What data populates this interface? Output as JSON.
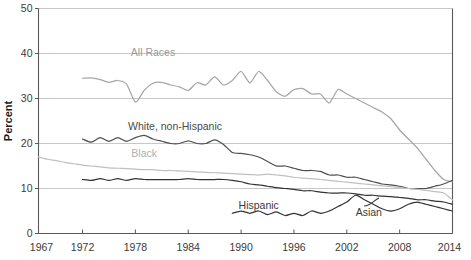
{
  "chart_data": {
    "type": "line",
    "title": "",
    "subtitle": "",
    "xlabel": "",
    "ylabel": "Percent",
    "xlim": [
      1967,
      2014
    ],
    "ylim": [
      0,
      50
    ],
    "grid": true,
    "legend_position": "inline-annotations",
    "y_ticks": [
      0,
      10,
      20,
      30,
      40,
      50
    ],
    "y_tick_labels": [
      "0",
      "10",
      "20",
      "30",
      "40",
      "50"
    ],
    "x_ticks": [
      1967,
      1972,
      1978,
      1984,
      1990,
      1996,
      2002,
      2008,
      2014
    ],
    "x_tick_labels": [
      "1967",
      "1972",
      "1978",
      "1984",
      "1990",
      "1996",
      "2002",
      "2008",
      "2014"
    ],
    "annotations": [
      {
        "text": "All Races",
        "x": 1980.0,
        "y": 39.5,
        "color": "#9a9a9a"
      },
      {
        "text": "White, non-Hispanic",
        "x": 1982.5,
        "y": 23.0,
        "color": "#4a4a4a"
      },
      {
        "text": "Black",
        "x": 1979.0,
        "y": 17.0,
        "color": "#b0b0b0"
      },
      {
        "text": "Hispanic",
        "x": 1992.0,
        "y": 5.5,
        "color": "#3a3a3a"
      },
      {
        "text": "Asian",
        "x": 2004.5,
        "y": 4.0,
        "color": "#3a3a3a"
      }
    ],
    "series": [
      {
        "name": "All Races",
        "color": "#a6a6a6",
        "x": [
          1972,
          1973,
          1974,
          1975,
          1976,
          1977,
          1978,
          1979,
          1980,
          1981,
          1982,
          1983,
          1984,
          1985,
          1986,
          1987,
          1988,
          1989,
          1990,
          1991,
          1992,
          1993,
          1994,
          1995,
          1996,
          1997,
          1998,
          1999,
          2000,
          2001,
          2002,
          2003,
          2004,
          2005,
          2006,
          2007,
          2008,
          2009,
          2010,
          2011,
          2012,
          2013,
          2014
        ],
        "values": [
          34.5,
          34.6,
          34.2,
          33.6,
          34.0,
          33.2,
          29.2,
          31.8,
          33.4,
          33.6,
          33.0,
          32.6,
          31.8,
          33.5,
          33.0,
          34.8,
          33.0,
          34.0,
          36.0,
          33.5,
          36.0,
          34.0,
          31.5,
          30.5,
          32.0,
          32.2,
          31.0,
          31.0,
          29.0,
          32.0,
          31.0,
          30.0,
          29.0,
          28.0,
          27.0,
          25.5,
          23.0,
          21.0,
          19.0,
          16.5,
          14.0,
          12.0,
          11.5
        ]
      },
      {
        "name": "White, non-Hispanic",
        "color": "#4f4f4f",
        "x": [
          1972,
          1973,
          1974,
          1975,
          1976,
          1977,
          1978,
          1979,
          1980,
          1981,
          1982,
          1983,
          1984,
          1985,
          1986,
          1987,
          1988,
          1989,
          1990,
          1991,
          1992,
          1993,
          1994,
          1995,
          1996,
          1997,
          1998,
          1999,
          2000,
          2001,
          2002,
          2003,
          2004,
          2005,
          2006,
          2007,
          2008,
          2009,
          2010,
          2011,
          2012,
          2013,
          2014
        ],
        "values": [
          21.0,
          20.3,
          21.3,
          20.5,
          21.3,
          20.5,
          21.3,
          21.8,
          21.0,
          20.5,
          20.0,
          20.0,
          20.6,
          20.0,
          20.0,
          20.8,
          19.8,
          18.0,
          17.8,
          17.5,
          17.0,
          16.0,
          15.0,
          15.0,
          14.5,
          14.0,
          14.0,
          13.8,
          13.0,
          13.0,
          12.5,
          12.5,
          12.0,
          11.5,
          11.0,
          10.8,
          10.5,
          10.0,
          10.0,
          10.0,
          10.5,
          11.0,
          11.8
        ]
      },
      {
        "name": "Black",
        "color": "#c0c0c0",
        "x": [
          1967,
          1968,
          1969,
          1970,
          1971,
          1972,
          1973,
          1974,
          1975,
          1976,
          1977,
          1978,
          1979,
          1980,
          1981,
          1982,
          1983,
          1984,
          1985,
          1986,
          1987,
          1988,
          1989,
          1990,
          1991,
          1992,
          1993,
          1994,
          1995,
          1996,
          1997,
          1998,
          1999,
          2000,
          2001,
          2002,
          2003,
          2004,
          2005,
          2006,
          2007,
          2008,
          2009,
          2010,
          2011,
          2012,
          2013,
          2014
        ],
        "values": [
          17.0,
          16.5,
          16.2,
          15.8,
          15.5,
          15.2,
          15.0,
          14.8,
          14.6,
          14.5,
          14.4,
          14.3,
          14.2,
          14.2,
          14.0,
          14.0,
          13.9,
          13.8,
          13.7,
          13.6,
          13.5,
          13.4,
          13.3,
          13.2,
          13.1,
          13.0,
          13.2,
          13.0,
          12.8,
          12.5,
          12.3,
          12.2,
          12.0,
          11.8,
          11.6,
          11.4,
          11.2,
          11.0,
          10.8,
          10.6,
          10.4,
          10.2,
          10.0,
          9.8,
          9.6,
          9.3,
          9.0,
          7.5
        ]
      },
      {
        "name": "Hispanic",
        "color": "#333333",
        "x": [
          1972,
          1973,
          1974,
          1975,
          1976,
          1977,
          1978,
          1979,
          1980,
          1981,
          1982,
          1983,
          1984,
          1985,
          1986,
          1987,
          1988,
          1989,
          1990,
          1991,
          1992,
          1993,
          1994,
          1995,
          1996,
          1997,
          1998,
          1999,
          2000,
          2001,
          2002,
          2003,
          2004,
          2005,
          2006,
          2007,
          2008,
          2009,
          2010,
          2011,
          2012,
          2013,
          2014
        ],
        "values": [
          12.0,
          11.8,
          12.2,
          11.8,
          12.2,
          11.8,
          12.2,
          12.0,
          12.0,
          12.0,
          12.0,
          12.0,
          12.2,
          12.0,
          12.0,
          12.0,
          12.0,
          11.8,
          11.5,
          11.0,
          10.8,
          10.5,
          10.2,
          10.0,
          9.8,
          9.5,
          9.5,
          9.2,
          9.0,
          9.0,
          9.0,
          8.8,
          8.5,
          8.5,
          8.3,
          8.2,
          8.0,
          7.8,
          7.5,
          7.5,
          7.2,
          7.0,
          6.5
        ]
      },
      {
        "name": "Asian",
        "color": "#333333",
        "x": [
          1989,
          1990,
          1991,
          1992,
          1993,
          1994,
          1995,
          1996,
          1997,
          1998,
          1999,
          2000,
          2001,
          2002,
          2003,
          2004,
          2005,
          2006,
          2007,
          2008,
          2009,
          2010,
          2011,
          2012,
          2013,
          2014
        ],
        "values": [
          4.5,
          5.0,
          4.5,
          5.0,
          4.2,
          4.8,
          4.0,
          4.5,
          4.0,
          5.0,
          4.5,
          5.0,
          6.0,
          7.0,
          8.5,
          7.5,
          6.5,
          5.5,
          5.0,
          5.5,
          6.5,
          7.0,
          6.5,
          6.0,
          5.5,
          5.0
        ]
      }
    ]
  }
}
